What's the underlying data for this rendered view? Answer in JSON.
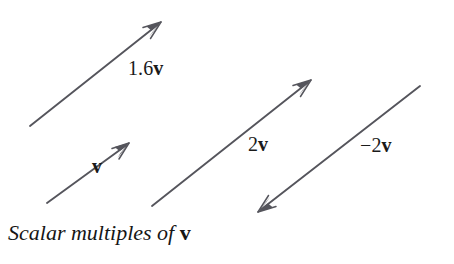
{
  "figure": {
    "caption_text": "Scalar multiples of",
    "caption_vector": "v",
    "line_color": "#55555c",
    "text_color": "#1a1a1a",
    "background_color": "#ffffff"
  },
  "vectors": [
    {
      "name": "1.6v",
      "scalar_label": "1.6",
      "vector_label": "v",
      "label_x": 128,
      "label_y": 58,
      "tail": [
        30,
        126
      ],
      "tip": [
        161,
        22
      ],
      "direction": "up-right"
    },
    {
      "name": "v",
      "scalar_label": "",
      "vector_label": "v",
      "label_x": 92,
      "label_y": 156,
      "tail": [
        47,
        203
      ],
      "tip": [
        129,
        143
      ],
      "direction": "up-right"
    },
    {
      "name": "2v",
      "scalar_label": "2",
      "vector_label": "v",
      "label_x": 248,
      "label_y": 134,
      "tail": [
        152,
        206
      ],
      "tip": [
        311,
        80
      ],
      "direction": "up-right"
    },
    {
      "name": "-2v",
      "scalar_label": "−2",
      "vector_label": "v",
      "label_x": 360,
      "label_y": 135,
      "tail": [
        420,
        86
      ],
      "tip": [
        258,
        212
      ],
      "direction": "down-left"
    }
  ],
  "chart_data": {
    "type": "diagram",
    "xlabel": "",
    "ylabel": "",
    "grid": false,
    "legend": "none",
    "annotations": [
      "1.6v",
      "v",
      "2v",
      "−2v",
      "Scalar multiples of v"
    ],
    "arrows": [
      {
        "label": "1.6v",
        "from": [
          30,
          126
        ],
        "to": [
          161,
          22
        ],
        "length": 167,
        "angle_deg": 38.5
      },
      {
        "label": "v",
        "from": [
          47,
          203
        ],
        "to": [
          129,
          143
        ],
        "length": 102,
        "angle_deg": 36.2
      },
      {
        "label": "2v",
        "from": [
          152,
          206
        ],
        "to": [
          311,
          80
        ],
        "length": 203,
        "angle_deg": 38.4
      },
      {
        "label": "−2v",
        "from": [
          420,
          86
        ],
        "to": [
          258,
          212
        ],
        "length": 205,
        "angle_deg": 37.9
      }
    ]
  }
}
